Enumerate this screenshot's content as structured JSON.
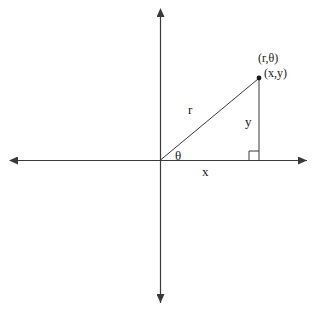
{
  "figure": {
    "background_color": "#ffffff",
    "stroke_color": "#3a3a3a",
    "text_color": "#1a1a1a"
  },
  "axes": {
    "origin": {
      "x": 160,
      "y": 160
    },
    "horizontal": {
      "x_start": 18,
      "x_end": 307,
      "y": 160,
      "arrows": "both"
    },
    "vertical": {
      "y_start": 17,
      "y_end": 303,
      "x": 160,
      "arrows": "both"
    }
  },
  "point": {
    "x": 259,
    "y": 78,
    "polar_label": "(r,θ)",
    "cartesian_label": "(x,y)"
  },
  "triangle": {
    "hypotenuse_label": "r",
    "angle_label": "θ",
    "adjacent_label": "x",
    "opposite_label": "y",
    "right_angle_marker": true
  }
}
